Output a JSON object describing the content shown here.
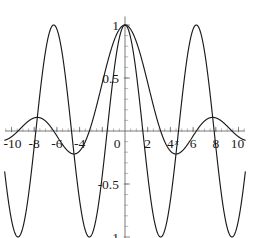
{
  "chart_data": {
    "type": "line",
    "title": "",
    "subtitle": "",
    "xlabel": "x",
    "ylabel": "",
    "xlim": [
      -10.6,
      10.6
    ],
    "ylim": [
      -1.12,
      1.1
    ],
    "grid": false,
    "legend": null,
    "background": "#ffffff",
    "axis_color": "#6b6b6b",
    "curve_color": "#1a1a1a",
    "x_ticks": [
      -10,
      -8,
      -6,
      -4,
      -2,
      0,
      2,
      4,
      6,
      8,
      10
    ],
    "x_tick_labels": [
      "-10",
      "-8",
      "-6",
      "-4",
      "",
      "0",
      "2",
      "4",
      "6",
      "8",
      "10"
    ],
    "y_ticks": [
      -1,
      -0.5,
      0,
      0.5,
      1
    ],
    "y_tick_labels": [
      "-1",
      "-0.5",
      "",
      "0.5",
      "1"
    ],
    "x_minor_step": 0.5,
    "y_minor_step": 0.1,
    "series": [
      {
        "name": "cos(x)",
        "expression": "cos(x)",
        "color": "#1a1a1a",
        "amplitude": 1,
        "period": 6.283,
        "maxima_x": [
          -6.283,
          0,
          6.283
        ],
        "minima_x": [
          -9.425,
          -3.142,
          3.142,
          9.425
        ],
        "maxima_y": 1,
        "minima_y": -1,
        "zero_crossings": [
          -10.996,
          -7.854,
          -4.712,
          -1.571,
          1.571,
          4.712,
          7.854,
          10.996
        ]
      },
      {
        "name": "sin(x)/x",
        "expression": "sin(x)/x",
        "color": "#1a1a1a",
        "value_at_zero": 1,
        "zero_crossings": [
          -9.425,
          -6.283,
          -3.142,
          3.142,
          6.283,
          9.425
        ],
        "local_minima": [
          {
            "x": -4.493,
            "y": -0.217
          },
          {
            "x": 4.493,
            "y": -0.217
          }
        ],
        "local_maxima": [
          {
            "x": -7.725,
            "y": 0.128
          },
          {
            "x": 0,
            "y": 1
          },
          {
            "x": 7.725,
            "y": 0.128
          }
        ]
      }
    ]
  },
  "labels": {
    "x_neg10": "-10",
    "x_neg8": "-8",
    "x_neg6": "-6",
    "x_neg4": "-4",
    "x_zero": "0",
    "x_2": "2",
    "x_4": "4",
    "x_6": "6",
    "x_8": "8",
    "x_10": "10",
    "y_1": "1",
    "y_05": "0.5",
    "y_neg05": "-0.5",
    "y_neg1": "-1",
    "x_axis_name": "x"
  }
}
